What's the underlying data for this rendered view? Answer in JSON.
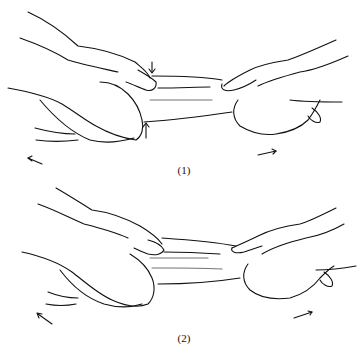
{
  "figure": {
    "panels": [
      {
        "id": 1,
        "caption": "(1)",
        "description": "Two hands grip and pull a forearm in opposite directions; vertical arrows indicate pressing/squeezing at the fracture site"
      },
      {
        "id": 2,
        "caption": "(2)",
        "description": "Two hands apply traction in opposite directions with the distal hand rotating/bending"
      }
    ],
    "colors": {
      "line": "#111111",
      "background": "#ffffff"
    }
  }
}
